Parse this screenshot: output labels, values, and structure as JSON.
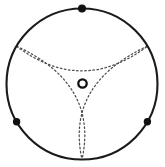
{
  "figure": {
    "canvas": {
      "width": 165,
      "height": 167,
      "background": "#ffffff"
    },
    "colors": {
      "outer_circle_stroke": "#1a1a1a",
      "deltoid_stroke": "#4d4d4d",
      "marker_fill": "#111111",
      "center_ring_stroke": "#111111",
      "center_ring_fill": "#ffffff"
    },
    "outer_circle": {
      "label": "outer circle",
      "cx": 82,
      "cy": 84,
      "r": 75.5,
      "stroke_width": 2.1,
      "fill": "none"
    },
    "center_marker": {
      "label": "center point",
      "cx": 82.5,
      "cy": 83.5,
      "outer_r": 4.2,
      "inner_r": 1.9,
      "stroke_width": 2.3
    },
    "boundary_markers": [
      {
        "label": "top marker",
        "angle_deg": 90,
        "cx": 82,
        "cy": 8.5,
        "r": 4.0
      },
      {
        "label": "bottom-left marker",
        "angle_deg": 210,
        "cx": 16.6,
        "cy": 121.8,
        "r": 3.7
      },
      {
        "label": "bottom-right marker",
        "angle_deg": 330,
        "cx": 147.4,
        "cy": 121.8,
        "r": 3.7
      }
    ],
    "deltoid": {
      "label": "dotted deltoid (three-cusped hypocycloid)",
      "stroke_width": 1.25,
      "dash_pattern": "1.6 2.5",
      "cusps": [
        {
          "label": "bottom cusp",
          "angle_deg": 270,
          "x": 82,
          "y": 159.5
        },
        {
          "label": "upper-left cusp",
          "angle_deg": 150,
          "x": 16.6,
          "y": 46.2
        },
        {
          "label": "upper-right cusp",
          "angle_deg": 30,
          "x": 147.4,
          "y": 46.2
        }
      ],
      "arcs": [
        {
          "label": "top arc",
          "from": "upper-left cusp",
          "to": "upper-right cusp",
          "path": "M 16.6 46.2 Q 82 95.5 147.4 46.2"
        },
        {
          "label": "left arc",
          "from": "upper-left cusp",
          "to": "bottom cusp",
          "path": "M 16.6 46.2 Q 98.6 84.0 82 159.5"
        },
        {
          "label": "right arc",
          "from": "upper-right cusp",
          "to": "bottom cusp",
          "path": "M 147.4 46.2 Q 65.4 84.0 82 159.5"
        }
      ]
    }
  }
}
